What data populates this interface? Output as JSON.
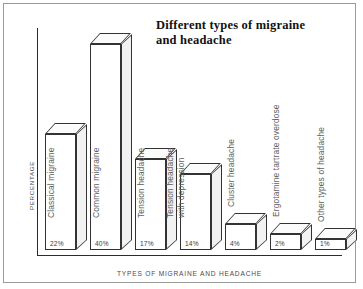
{
  "chart": {
    "title": "Different types of migraine and headache",
    "title_line1": "Different types of migraine",
    "title_line2": "and headache",
    "xlabel": "TYPES OF MIGRAINE AND HEADACHE",
    "ylabel": "PERCENTAGE"
  },
  "chart_data": {
    "type": "bar",
    "title": "Different types of migraine and headache",
    "xlabel": "TYPES OF MIGRAINE AND HEADACHE",
    "ylabel": "PERCENTAGE",
    "ylim": [
      0,
      40
    ],
    "grid": false,
    "legend": "none",
    "style": "3d-isometric-bars",
    "categories": [
      "Classical migraine",
      "Common migraine",
      "Tension headache",
      "Tension headache with depression",
      "Cluster headache",
      "Ergotamine tartrate overdose",
      "Other types of headache"
    ],
    "values": [
      22,
      40,
      17,
      14,
      4,
      2,
      1
    ],
    "value_labels": [
      "22%",
      "40%",
      "17%",
      "14%",
      "4%",
      "2%",
      "1%"
    ]
  },
  "bars": [
    {
      "label_line1": "Classical migraine",
      "label_line2": "",
      "value": 22,
      "value_label": "22%"
    },
    {
      "label_line1": "Common migraine",
      "label_line2": "",
      "value": 40,
      "value_label": "40%"
    },
    {
      "label_line1": "Tension headache",
      "label_line2": "",
      "value": 17,
      "value_label": "17%"
    },
    {
      "label_line1": "Tension headache",
      "label_line2": "with depression",
      "value": 14,
      "value_label": "14%"
    },
    {
      "label_line1": "Cluster headache",
      "label_line2": "",
      "value": 4,
      "value_label": "4%"
    },
    {
      "label_line1": "Ergotamine tartrate overdose",
      "label_line2": "",
      "value": 2,
      "value_label": "2%"
    },
    {
      "label_line1": "Other types of headache",
      "label_line2": "",
      "value": 1,
      "value_label": "1%"
    }
  ]
}
